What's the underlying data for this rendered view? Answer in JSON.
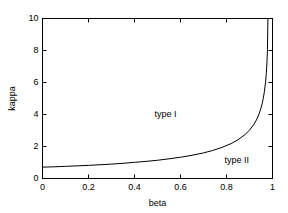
{
  "chart_data": {
    "type": "line",
    "title": "",
    "subtitle": "",
    "xlabel": "beta",
    "ylabel": "kappa",
    "xlim": [
      0,
      1
    ],
    "ylim": [
      0,
      10
    ],
    "grid": false,
    "legend": null,
    "legend_position": "none",
    "xticks": [
      "0",
      "0.2",
      "0.4",
      "0.6",
      "0.8",
      "1"
    ],
    "xtick_values": [
      0,
      0.2,
      0.4,
      0.6,
      0.8,
      1
    ],
    "yticks": [
      "0",
      "2",
      "4",
      "6",
      "8",
      "10"
    ],
    "ytick_values": [
      0,
      2,
      4,
      6,
      8,
      10
    ],
    "series": [
      {
        "name": "phase boundary",
        "color": "#000000",
        "x": [
          0.0,
          0.05,
          0.1,
          0.15,
          0.2,
          0.25,
          0.3,
          0.35,
          0.4,
          0.45,
          0.5,
          0.55,
          0.6,
          0.65,
          0.7,
          0.74,
          0.78,
          0.82,
          0.85,
          0.88,
          0.9,
          0.92,
          0.93,
          0.94,
          0.95,
          0.955,
          0.96,
          0.965,
          0.97,
          0.973,
          0.976,
          0.978,
          0.98
        ],
        "y": [
          0.71,
          0.73,
          0.76,
          0.79,
          0.82,
          0.86,
          0.9,
          0.95,
          1.01,
          1.07,
          1.14,
          1.23,
          1.33,
          1.45,
          1.6,
          1.75,
          1.94,
          2.18,
          2.42,
          2.74,
          3.02,
          3.4,
          3.65,
          3.97,
          4.4,
          4.68,
          5.02,
          5.45,
          6.05,
          6.55,
          7.3,
          8.05,
          10.0
        ]
      }
    ],
    "annotations": [
      {
        "text": "type I",
        "x": 0.535,
        "y": 3.95
      },
      {
        "text": "type II",
        "x": 0.845,
        "y": 1.12
      }
    ]
  },
  "figure": {
    "background_color": "#ffffff",
    "axis_color": "#000000",
    "line_color": "#000000"
  }
}
